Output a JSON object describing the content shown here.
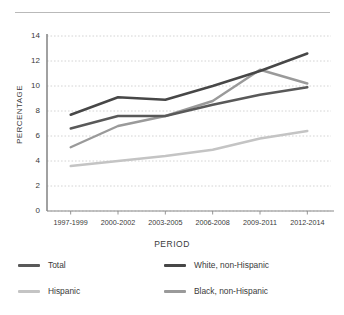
{
  "chart_data": {
    "type": "line",
    "title": "",
    "xlabel": "PERIOD",
    "ylabel": "PERCENTAGE",
    "categories": [
      "1997-1999",
      "2000-2002",
      "2003-2005",
      "2006-2008",
      "2009-2011",
      "2012-2014"
    ],
    "ylim": [
      0,
      14
    ],
    "yticks": [
      0,
      2,
      4,
      6,
      8,
      10,
      12,
      14
    ],
    "grid": "horizontal-dotted",
    "legend_position": "bottom",
    "series": [
      {
        "name": "Total",
        "color": "#595959",
        "values": [
          6.6,
          7.6,
          7.6,
          8.5,
          9.3,
          9.9
        ]
      },
      {
        "name": "White, non-Hispanic",
        "color": "#474747",
        "values": [
          7.7,
          9.1,
          8.9,
          10.0,
          11.2,
          12.6
        ]
      },
      {
        "name": "Hispanic",
        "color": "#c4c4c4",
        "values": [
          3.6,
          4.0,
          4.4,
          4.9,
          5.8,
          6.4
        ]
      },
      {
        "name": "Black, non-Hispanic",
        "color": "#9a9a9a",
        "values": [
          5.1,
          6.8,
          7.6,
          8.8,
          11.3,
          10.2
        ]
      }
    ]
  },
  "axis": {
    "y_tick_labels": [
      "0",
      "2",
      "4",
      "6",
      "8",
      "10",
      "12",
      "14"
    ],
    "x_tick_labels": [
      "1997-1999",
      "2000-2002",
      "2003-2005",
      "2006-2008",
      "2009-2011",
      "2012-2014"
    ],
    "y_title": "PERCENTAGE",
    "x_title": "PERIOD"
  },
  "legend": {
    "items": [
      {
        "label": "Total",
        "color": "#595959"
      },
      {
        "label": "White, non-Hispanic",
        "color": "#474747"
      },
      {
        "label": "Hispanic",
        "color": "#c4c4c4"
      },
      {
        "label": "Black, non-Hispanic",
        "color": "#9a9a9a"
      }
    ]
  },
  "style": {
    "background": "#ffffff",
    "axis_color": "#8a8a8a",
    "grid_color": "#c9c9c9",
    "text_color": "#3a3a3a",
    "rule_color": "#b9b9b9"
  }
}
